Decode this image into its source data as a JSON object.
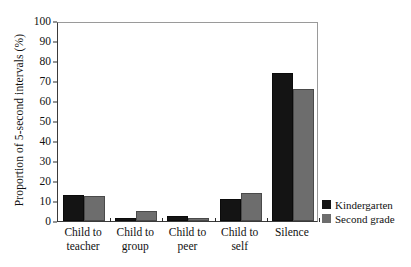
{
  "chart_data": {
    "type": "bar",
    "title": "",
    "xlabel": "",
    "ylabel": "Proportion of 5-second intervals (%)",
    "ylim": [
      0,
      100
    ],
    "yticks": [
      0,
      10,
      20,
      30,
      40,
      50,
      60,
      70,
      80,
      90,
      100
    ],
    "ytick_labels": [
      "0",
      "10",
      "20",
      "30",
      "40",
      "50",
      "60",
      "70",
      "80",
      "90",
      "100"
    ],
    "grid": false,
    "legend_position": "right-bottom outside",
    "categories": [
      "Child to teacher",
      "Child to group",
      "Child to peer",
      "Child to self",
      "Silence"
    ],
    "category_lines": [
      [
        "Child to",
        "teacher"
      ],
      [
        "Child to",
        "group"
      ],
      [
        "Child to",
        "peer"
      ],
      [
        "Child to",
        "self"
      ],
      [
        "Silence",
        ""
      ]
    ],
    "series": [
      {
        "name": "Kindergarten",
        "color": "#141414",
        "values": [
          13,
          1.5,
          2.5,
          11,
          74
        ]
      },
      {
        "name": "Second grade",
        "color": "#6d6d6d",
        "values": [
          12.5,
          5,
          1.5,
          14,
          66
        ]
      }
    ]
  },
  "legend": {
    "items": [
      {
        "label": "Kindergarten",
        "color": "#141414"
      },
      {
        "label": "Second grade",
        "color": "#6d6d6d"
      }
    ]
  },
  "axis": {
    "y_title": "Proportion of 5-second intervals (%)"
  }
}
